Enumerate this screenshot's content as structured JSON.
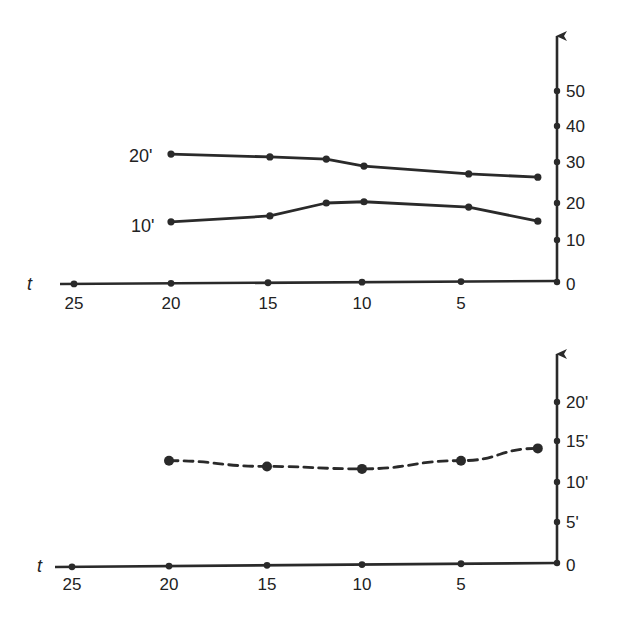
{
  "colors": {
    "ink": "#2a2a2a",
    "background": "#ffffff"
  },
  "chart_data": [
    {
      "type": "line",
      "panel": "top",
      "title": "",
      "xlabel": "t",
      "ylabel": "",
      "x_direction": "reversed",
      "xlim": [
        27,
        0
      ],
      "ylim": [
        0,
        55
      ],
      "x_ticks": [
        25,
        20,
        15,
        10,
        5
      ],
      "x_tick_labels": [
        "25",
        "20",
        "15",
        "10",
        "5"
      ],
      "y_ticks": [
        0,
        10,
        20,
        30,
        40,
        50
      ],
      "y_tick_labels": [
        "0",
        "10",
        "20",
        "30",
        "40",
        "50"
      ],
      "grid": false,
      "legend": null,
      "series": [
        {
          "name": "20'",
          "style": "solid",
          "x": [
            20,
            14.9,
            11.9,
            9.9,
            4.6,
            1.0
          ],
          "values": [
            32.2,
            31.4,
            30.8,
            29.0,
            27.1,
            26.3
          ]
        },
        {
          "name": "10'",
          "style": "solid",
          "x": [
            20,
            14.9,
            11.9,
            9.9,
            4.6,
            1.0
          ],
          "values": [
            14.9,
            16.5,
            20.0,
            20.3,
            18.9,
            15.1
          ]
        }
      ],
      "annotations": [
        "20'",
        "10'"
      ]
    },
    {
      "type": "line",
      "panel": "bottom",
      "title": "",
      "xlabel": "t",
      "ylabel": "",
      "x_direction": "reversed",
      "xlim": [
        27,
        0
      ],
      "ylim": [
        0,
        26
      ],
      "x_ticks": [
        25,
        20,
        15,
        10,
        5
      ],
      "x_tick_labels": [
        "25",
        "20",
        "15",
        "10",
        "5"
      ],
      "y_ticks": [
        0,
        5,
        10,
        15,
        20
      ],
      "y_tick_labels": [
        "0",
        "5'",
        "10'",
        "15'",
        "20'"
      ],
      "grid": false,
      "legend": null,
      "series": [
        {
          "name": "dashed",
          "style": "dashed",
          "x": [
            20,
            15,
            10,
            5,
            1.0
          ],
          "values": [
            12.6,
            11.9,
            11.6,
            12.6,
            14.1
          ]
        }
      ],
      "annotations": []
    }
  ]
}
